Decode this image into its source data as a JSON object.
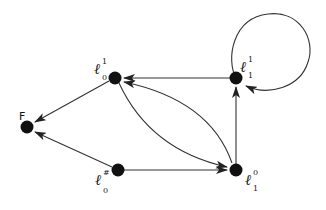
{
  "diagram": {
    "type": "directed-graph",
    "nodes": [
      {
        "id": "l01",
        "base": "ℓ",
        "sub": "0",
        "sup": "1",
        "x": 115,
        "y": 78
      },
      {
        "id": "l11",
        "base": "ℓ",
        "sub": "1",
        "sup": "1",
        "x": 236,
        "y": 78
      },
      {
        "id": "F",
        "label": "F",
        "x": 27,
        "y": 127
      },
      {
        "id": "l0h",
        "base": "ℓ",
        "sub": "0",
        "sup": "#",
        "x": 118,
        "y": 170
      },
      {
        "id": "l10",
        "base": "ℓ",
        "sub": "1",
        "sup": "0",
        "x": 236,
        "y": 170
      }
    ],
    "edges": [
      {
        "from": "l11",
        "to": "l01",
        "style": "straight"
      },
      {
        "from": "l01",
        "to": "F",
        "style": "straight"
      },
      {
        "from": "l0h",
        "to": "F",
        "style": "straight"
      },
      {
        "from": "l0h",
        "to": "l10",
        "style": "straight"
      },
      {
        "from": "l10",
        "to": "l11",
        "style": "straight"
      },
      {
        "from": "l01",
        "to": "l10",
        "style": "curved-lower"
      },
      {
        "from": "l10",
        "to": "l01",
        "style": "curved-upper"
      },
      {
        "from": "l11",
        "to": "l11",
        "style": "self-loop"
      }
    ],
    "colors": {
      "node": "#111111",
      "edge": "#333333",
      "background": "#ffffff"
    }
  }
}
